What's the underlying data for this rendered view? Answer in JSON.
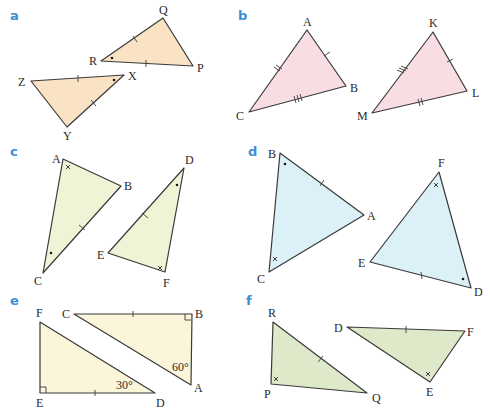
{
  "colors": {
    "part_label": "#3a8fd6",
    "a_fill": "#f9e3c4",
    "b_fill": "#f8dde3",
    "c_fill": "#f1f3d6",
    "d_fill": "#dcf0f8",
    "e_fill": "#fbf5d9",
    "f_fill": "#dde9c8"
  },
  "parts": [
    {
      "label": "a",
      "triangles": [
        {
          "vertices": [
            "Q",
            "P",
            "R"
          ],
          "marks": {
            "QR": "single tick",
            "RP": "single tick",
            "R": "dot"
          }
        },
        {
          "vertices": [
            "Z",
            "X",
            "Y"
          ],
          "marks": {
            "ZX": "single tick",
            "XY": "single tick",
            "X": "dot"
          }
        }
      ]
    },
    {
      "label": "b",
      "triangles": [
        {
          "vertices": [
            "A",
            "B",
            "C"
          ],
          "marks": {
            "AC": "double tick",
            "AB": "single tick",
            "CB": "triple tick"
          }
        },
        {
          "vertices": [
            "K",
            "L",
            "M"
          ],
          "marks": {
            "KM": "triple tick",
            "KL": "single tick",
            "ML": "double tick"
          }
        }
      ]
    },
    {
      "label": "c",
      "triangles": [
        {
          "vertices": [
            "A",
            "B",
            "C"
          ],
          "marks": {
            "A": "cross",
            "C": "dot",
            "BC": "single tick"
          }
        },
        {
          "vertices": [
            "D",
            "E",
            "F"
          ],
          "marks": {
            "D": "dot",
            "F": "cross",
            "DE": "single tick"
          }
        }
      ]
    },
    {
      "label": "d",
      "triangles": [
        {
          "vertices": [
            "B",
            "A",
            "C"
          ],
          "marks": {
            "B": "dot",
            "C": "cross",
            "BA": "single tick"
          }
        },
        {
          "vertices": [
            "F",
            "E",
            "D"
          ],
          "marks": {
            "F": "cross",
            "D": "dot",
            "ED": "single tick"
          }
        }
      ]
    },
    {
      "label": "e",
      "triangles": [
        {
          "vertices": [
            "C",
            "B",
            "A"
          ],
          "marks": {
            "B": "right angle",
            "A": "60°",
            "CB": "single tick"
          }
        },
        {
          "vertices": [
            "F",
            "E",
            "D"
          ],
          "marks": {
            "E": "right angle",
            "D": "30°",
            "ED": "single tick"
          }
        }
      ]
    },
    {
      "label": "f",
      "triangles": [
        {
          "vertices": [
            "R",
            "P",
            "Q"
          ],
          "marks": {
            "P": "cross",
            "RQ": "single tick"
          }
        },
        {
          "vertices": [
            "D",
            "F",
            "E"
          ],
          "marks": {
            "E": "cross",
            "DF": "single tick"
          }
        }
      ]
    }
  ],
  "labels": {
    "a": {
      "part": "a",
      "Q": "Q",
      "P": "P",
      "R": "R",
      "Z": "Z",
      "X": "X",
      "Y": "Y"
    },
    "b": {
      "part": "b",
      "A": "A",
      "B": "B",
      "C": "C",
      "K": "K",
      "L": "L",
      "M": "M"
    },
    "c": {
      "part": "c",
      "A": "A",
      "B": "B",
      "C": "C",
      "D": "D",
      "E": "E",
      "F": "F"
    },
    "d": {
      "part": "d",
      "B": "B",
      "A": "A",
      "C": "C",
      "F": "F",
      "E": "E",
      "D": "D"
    },
    "e": {
      "part": "e",
      "C": "C",
      "B": "B",
      "A": "A",
      "F": "F",
      "E": "E",
      "D": "D",
      "angle_A": "60°",
      "angle_D": "30°"
    },
    "f": {
      "part": "f",
      "R": "R",
      "P": "P",
      "Q": "Q",
      "D": "D",
      "F": "F",
      "E": "E"
    }
  }
}
